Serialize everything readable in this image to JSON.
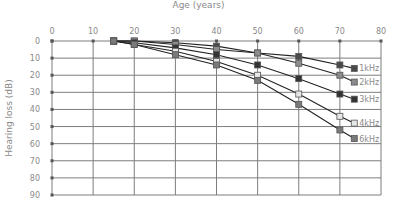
{
  "chart_data": {
    "type": "line",
    "title": "",
    "xlabel": "Age (years)",
    "ylabel": "Hearing loss (dB)",
    "x_axis_position": "top",
    "y_axis_inverted": true,
    "xlim": [
      0,
      80
    ],
    "ylim": [
      0,
      90
    ],
    "xticks": [
      0,
      10,
      20,
      30,
      40,
      50,
      60,
      70,
      80
    ],
    "yticks": [
      0,
      10,
      20,
      30,
      40,
      50,
      60,
      70,
      80,
      90
    ],
    "grid": true,
    "legend_position": "inline-right-end-of-lines",
    "x": [
      15,
      20,
      30,
      40,
      50,
      60,
      70
    ],
    "series": [
      {
        "name": "1kHz",
        "values": [
          0,
          0,
          1,
          3,
          7,
          9,
          14
        ],
        "marker": "square",
        "marker_color": "#4a4a4a",
        "label_y": 16
      },
      {
        "name": "2kHz",
        "values": [
          0,
          0,
          2,
          5,
          7,
          13,
          20
        ],
        "marker": "square",
        "marker_color": "#8c8c8c",
        "label_y": 24
      },
      {
        "name": "3kHz",
        "values": [
          0,
          1,
          4,
          8,
          14,
          22,
          31
        ],
        "marker": "square",
        "marker_color": "#333333",
        "label_y": 34
      },
      {
        "name": "4kHz",
        "values": [
          0,
          2,
          6,
          12,
          20,
          31,
          44
        ],
        "marker": "square",
        "marker_color": "#e6e6e6",
        "label_y": 48
      },
      {
        "name": "6kHz",
        "values": [
          0,
          2,
          8,
          14,
          23,
          37,
          52
        ],
        "marker": "square",
        "marker_color": "#7a7a7a",
        "label_y": 57
      }
    ]
  },
  "layout": {
    "plot_left": 52,
    "plot_right": 381,
    "plot_top": 41,
    "plot_bottom": 195,
    "legend_marker_x": 73.5
  },
  "colors": {
    "grid": "#7d7d7d",
    "line": "#222222",
    "tick_text": "#8a8a8a",
    "marker_stroke": "#555555"
  }
}
